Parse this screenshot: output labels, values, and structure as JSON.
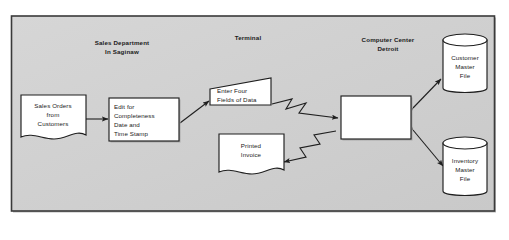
{
  "figure": {
    "type": "system-flowchart",
    "background_color": "#d0d0d0",
    "frame_border_color": "#3a3a3a",
    "shape_fill_color": "#ffffff",
    "line_color": "#1f1f1f"
  },
  "zones": [
    {
      "id": "sales-department",
      "label_line1": "Sales Department",
      "label_line2": "In Saginaw"
    },
    {
      "id": "terminal",
      "label_line1": "Terminal",
      "label_line2": ""
    },
    {
      "id": "computer-center",
      "label_line1": "Computer Center",
      "label_line2": "Detroit"
    }
  ],
  "nodes": [
    {
      "id": "sales-orders",
      "shape": "document",
      "lines": [
        "Sales Orders",
        "from",
        "Customers"
      ],
      "align": "center"
    },
    {
      "id": "edit-process",
      "shape": "process",
      "lines": [
        "Edit for",
        "Completeness",
        "Date and",
        "Time Stamp"
      ],
      "align": "left"
    },
    {
      "id": "enter-four-fields",
      "shape": "input-trapezoid",
      "lines": [
        "Enter Four",
        "Fields of Data"
      ],
      "align": "left"
    },
    {
      "id": "printed-invoice",
      "shape": "document",
      "lines": [
        "Printed",
        "Invoice"
      ],
      "align": "center"
    },
    {
      "id": "central-processor",
      "shape": "process",
      "lines": [],
      "align": "center"
    },
    {
      "id": "customer-master-file",
      "shape": "cylinder",
      "lines": [
        "Customer",
        "Master",
        "File"
      ],
      "align": "center"
    },
    {
      "id": "inventory-master-file",
      "shape": "cylinder",
      "lines": [
        "Inventory",
        "Master",
        "File"
      ],
      "align": "center"
    }
  ],
  "connectors": [
    {
      "id": "orders-to-edit",
      "style": "straight-arrow",
      "from": "sales-orders",
      "to": "edit-process"
    },
    {
      "id": "edit-to-terminal",
      "style": "straight-arrow",
      "from": "edit-process",
      "to": "enter-four-fields"
    },
    {
      "id": "terminal-to-processor",
      "style": "zigzag-arrow",
      "from": "enter-four-fields",
      "to": "central-processor"
    },
    {
      "id": "processor-to-invoice",
      "style": "zigzag-arrow",
      "from": "central-processor",
      "to": "printed-invoice"
    },
    {
      "id": "processor-customer-file",
      "style": "double-arrow",
      "from": "central-processor",
      "to": "customer-master-file"
    },
    {
      "id": "processor-inventory-file",
      "style": "double-arrow",
      "from": "central-processor",
      "to": "inventory-master-file"
    }
  ]
}
